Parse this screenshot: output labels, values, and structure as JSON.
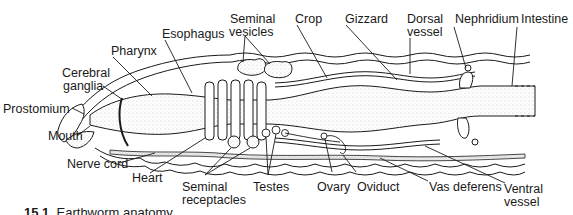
{
  "figure": {
    "labels": {
      "prostomium": "Prostomium",
      "mouth": "Mouth",
      "cerebral_ganglia_1": "Cerebral",
      "cerebral_ganglia_2": "ganglia",
      "pharynx": "Pharynx",
      "esophagus": "Esophagus",
      "seminal_vesicles_1": "Seminal",
      "seminal_vesicles_2": "vesicles",
      "crop": "Crop",
      "gizzard": "Gizzard",
      "dorsal_vessel_1": "Dorsal",
      "dorsal_vessel_2": "vessel",
      "nephridium": "Nephridium",
      "intestine": "Intestine",
      "nerve_cord": "Nerve cord",
      "heart": "Heart",
      "seminal_receptacles_1": "Seminal",
      "seminal_receptacles_2": "receptacles",
      "testes": "Testes",
      "ovary": "Ovary",
      "oviduct": "Oviduct",
      "vas_deferens": "Vas deferens",
      "ventral_vessel_1": "Ventral",
      "ventral_vessel_2": "vessel"
    },
    "caption": {
      "number": "15.1",
      "text": "Earthworm anatomy"
    },
    "colors": {
      "ink": "#1a1a1a",
      "stipple": "#bdbdbd",
      "background": "#ffffff"
    }
  }
}
